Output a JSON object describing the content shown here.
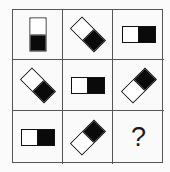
{
  "puzzle": {
    "rows": 3,
    "cols": 3,
    "border_color": "#555555",
    "shape": {
      "type": "rectangle-half-white-half-black",
      "width": 34,
      "height": 17,
      "white_color": "#ffffff",
      "black_color": "#0a0a0a"
    },
    "cells": [
      {
        "row": 1,
        "col": 1,
        "kind": "shape",
        "rotation_deg": 90,
        "description": "vertical, white top, black bottom"
      },
      {
        "row": 1,
        "col": 2,
        "kind": "shape",
        "rotation_deg": 45,
        "description": "diagonal, white upper-left, black lower-right"
      },
      {
        "row": 1,
        "col": 3,
        "kind": "shape",
        "rotation_deg": 0,
        "description": "horizontal, white left, black right"
      },
      {
        "row": 2,
        "col": 1,
        "kind": "shape",
        "rotation_deg": 45,
        "description": "diagonal, white upper-left, black lower-right"
      },
      {
        "row": 2,
        "col": 2,
        "kind": "shape",
        "rotation_deg": 0,
        "description": "horizontal, white left, black right"
      },
      {
        "row": 2,
        "col": 3,
        "kind": "shape",
        "rotation_deg": -45,
        "description": "diagonal, white lower-left, black upper-right"
      },
      {
        "row": 3,
        "col": 1,
        "kind": "shape",
        "rotation_deg": 0,
        "description": "horizontal, white left, black right"
      },
      {
        "row": 3,
        "col": 2,
        "kind": "shape",
        "rotation_deg": -45,
        "description": "diagonal, white lower-left, black upper-right"
      },
      {
        "row": 3,
        "col": 3,
        "kind": "unknown",
        "label": "?"
      }
    ]
  }
}
